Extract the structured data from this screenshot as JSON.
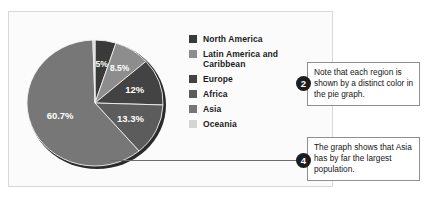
{
  "figure": {
    "panel_background": "#fbfbfb",
    "panel_border": "#d8d8d8"
  },
  "chart_data": {
    "type": "pie",
    "title": "",
    "categories": [
      "North America",
      "Latin America and Caribbean",
      "Europe",
      "Africa",
      "Asia",
      "Oceania"
    ],
    "values": [
      5,
      8.5,
      12,
      13.3,
      60.7,
      0.5
    ],
    "data_labels": [
      "5%",
      "8.5%",
      "12%",
      "13.3%",
      "60.7%",
      "0.5%"
    ],
    "colors": [
      "#3a3a3a",
      "#8d8d8d",
      "#434343",
      "#5c5c5c",
      "#777777",
      "#d5d5d5"
    ],
    "label_colors": [
      "#ffffff",
      "#ffffff",
      "#ffffff",
      "#ffffff",
      "#ffffff",
      "#1a1a1a"
    ],
    "units": "percent",
    "legend_position": "right",
    "grid": false,
    "start_angle_deg": -90,
    "direction": "clockwise"
  },
  "legend": {
    "items": [
      {
        "label": "North America",
        "color": "#3a3a3a"
      },
      {
        "label": "Latin America and\nCaribbean",
        "color": "#8d8d8d"
      },
      {
        "label": "Europe",
        "color": "#434343"
      },
      {
        "label": "Africa",
        "color": "#5c5c5c"
      },
      {
        "label": "Asia",
        "color": "#777777"
      },
      {
        "label": "Oceania",
        "color": "#d5d5d5"
      }
    ]
  },
  "callouts": [
    {
      "number": "2",
      "text": "Note that each region is shown by a distinct color in the pie graph."
    },
    {
      "number": "4",
      "text": "The graph shows that Asia has by far the largest population."
    }
  ]
}
